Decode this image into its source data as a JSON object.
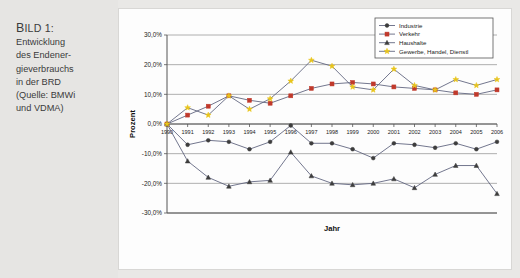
{
  "caption": {
    "title_small_caps": "B",
    "title_rest": "ILD 1:",
    "lines": [
      "Entwicklung",
      "des Endener-",
      "gieverbrauchs",
      "in der BRD",
      "(Quelle: BMWi",
      "und VDMA)"
    ]
  },
  "chart_data": {
    "type": "line",
    "title": "",
    "xlabel": "Jahr",
    "ylabel": "Prozent",
    "ylim": [
      -30,
      30
    ],
    "ytick_labels": [
      "30,0%",
      "20,0%",
      "10,0%",
      "0,0%",
      "-10,0%",
      "-20,0%",
      "-30,0%"
    ],
    "ytick_values": [
      30,
      20,
      10,
      0,
      -10,
      -20,
      -30
    ],
    "grid": true,
    "legend_position": "top-right",
    "categories": [
      "1990",
      "1991",
      "1992",
      "1993",
      "1994",
      "1995",
      "1996",
      "1997",
      "1998",
      "1999",
      "2000",
      "2001",
      "2002",
      "2003",
      "2004",
      "2005",
      "2006"
    ],
    "series": [
      {
        "name": "Industrie",
        "marker": "circle",
        "color": "#3d3d3d",
        "values": [
          0.0,
          -7.0,
          -5.5,
          -6.0,
          -8.5,
          -6.0,
          -0.5,
          -6.5,
          -6.5,
          -8.5,
          -11.5,
          -6.5,
          -7.0,
          -8.0,
          -6.5,
          -8.5,
          -6.0
        ]
      },
      {
        "name": "Verkehr",
        "marker": "square",
        "color": "#c0392b",
        "values": [
          0.0,
          3.0,
          6.0,
          9.5,
          8.0,
          7.0,
          9.5,
          12.0,
          13.5,
          14.0,
          13.5,
          12.5,
          12.0,
          11.5,
          10.5,
          10.0,
          11.5
        ]
      },
      {
        "name": "Haushalte",
        "marker": "triangle",
        "color": "#3d3d3d",
        "values": [
          0.0,
          -12.5,
          -18.0,
          -21.0,
          -19.5,
          -19.0,
          -9.5,
          -17.5,
          -20.0,
          -20.5,
          -20.0,
          -18.5,
          -21.5,
          -17.0,
          -14.0,
          -14.0,
          -23.5
        ]
      },
      {
        "name": "Gewerbe, Handel, Dienstl",
        "marker": "star",
        "color": "#e8c41b",
        "values": [
          0.0,
          5.5,
          3.0,
          9.5,
          5.0,
          8.5,
          14.5,
          21.5,
          19.5,
          12.5,
          11.5,
          18.5,
          13.0,
          11.5,
          15.0,
          13.0,
          15.0
        ]
      }
    ]
  }
}
